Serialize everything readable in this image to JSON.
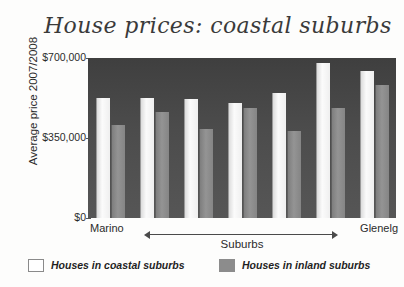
{
  "chart_data": {
    "type": "bar",
    "title": "House prices: coastal suburbs",
    "xlabel": "Suburbs",
    "ylabel": "Average price 2007/2008",
    "ylim": [
      0,
      700000
    ],
    "yticks": [
      0,
      350000,
      700000
    ],
    "ytick_labels": [
      "$0",
      "$350,000",
      "$700,000"
    ],
    "grid": false,
    "legend_position": "bottom",
    "x_axis_left_end_label": "Marino",
    "x_axis_right_end_label": "Glenelg",
    "x_axis_arrow": "double-headed",
    "categories": [
      "1",
      "2",
      "3",
      "4",
      "5",
      "6",
      "7"
    ],
    "series": [
      {
        "name": "Houses in coastal suburbs",
        "color": "#f2f2f2",
        "values": [
          525000,
          525000,
          520000,
          505000,
          545000,
          680000,
          645000
        ]
      },
      {
        "name": "Houses in inland suburbs",
        "color": "#8c8c8c",
        "values": [
          405000,
          465000,
          390000,
          480000,
          380000,
          480000,
          580000
        ]
      }
    ]
  },
  "legend": {
    "entries": [
      {
        "label": "Houses in coastal suburbs",
        "swatch": "white-outlined-square"
      },
      {
        "label": "Houses in inland suburbs",
        "swatch": "gray-filled-square"
      }
    ]
  }
}
